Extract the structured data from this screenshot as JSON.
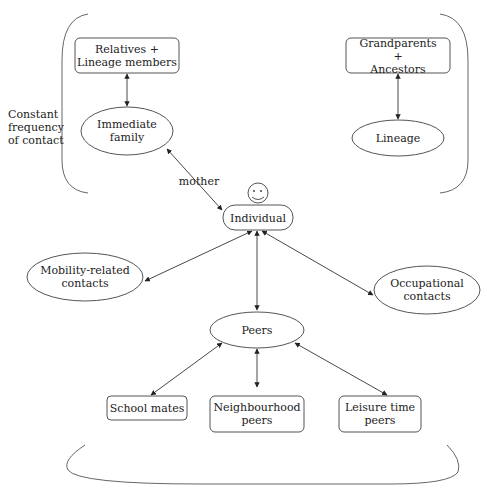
{
  "diagram": {
    "side_label": "Constant\nfrequency\nof contact",
    "edge_label": "mother",
    "nodes": {
      "relatives": "Relatives +\nLineage members",
      "immediate_family": "Immediate\nfamily",
      "grandparents": "Grandparents +\nAncestors",
      "lineage": "Lineage",
      "individual": "Individual",
      "mobility": "Mobility-related\ncontacts",
      "occupational": "Occupational\ncontacts",
      "peers": "Peers",
      "school_mates": "School mates",
      "neighbourhood": "Neighbourhood\npeers",
      "leisure": "Leisure time\npeers"
    },
    "edges": [
      {
        "from": "relatives",
        "to": "immediate_family",
        "type": "bidirectional"
      },
      {
        "from": "grandparents",
        "to": "lineage",
        "type": "bidirectional"
      },
      {
        "from": "immediate_family",
        "to": "individual",
        "type": "bidirectional",
        "label": "mother"
      },
      {
        "from": "individual",
        "to": "mobility",
        "type": "bidirectional"
      },
      {
        "from": "individual",
        "to": "peers",
        "type": "bidirectional"
      },
      {
        "from": "individual",
        "to": "occupational",
        "type": "bidirectional"
      },
      {
        "from": "peers",
        "to": "school_mates",
        "type": "bidirectional"
      },
      {
        "from": "peers",
        "to": "neighbourhood",
        "type": "bidirectional"
      },
      {
        "from": "peers",
        "to": "leisure",
        "type": "bidirectional"
      }
    ],
    "colors": {
      "stroke": "#555555",
      "text": "#222222"
    }
  }
}
